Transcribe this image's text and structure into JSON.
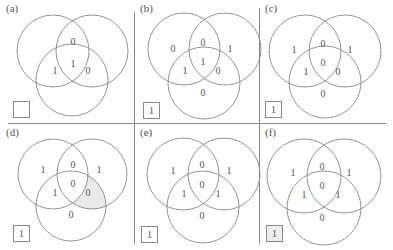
{
  "figure": {
    "layout": {
      "rows": 2,
      "cols": 3
    },
    "panels": [
      {
        "label": "(a)",
        "regions": {
          "A_only": "",
          "B_only": "",
          "C_only": "",
          "AB": "0",
          "AC": "1",
          "BC": "0",
          "ABC": "1"
        },
        "box_value": "",
        "shaded_region": null
      },
      {
        "label": "(b)",
        "regions": {
          "A_only": "0",
          "B_only": "1",
          "C_only": "0",
          "AB": "0",
          "AC": "1",
          "BC": "0",
          "ABC": "1"
        },
        "box_value": "1",
        "shaded_region": null
      },
      {
        "label": "(c)",
        "regions": {
          "A_only": "1",
          "B_only": "1",
          "C_only": "0",
          "AB": "0",
          "AC": "1",
          "BC": "0",
          "ABC": "0"
        },
        "box_value": "1",
        "shaded_region": null
      },
      {
        "label": "(d)",
        "regions": {
          "A_only": "1",
          "B_only": "1",
          "C_only": "0",
          "AB": "0",
          "AC": "1",
          "BC": "0",
          "ABC": "0"
        },
        "box_value": "1",
        "shaded_region": "BC"
      },
      {
        "label": "(e)",
        "regions": {
          "A_only": "1",
          "B_only": "1",
          "C_only": "0",
          "AB": "0",
          "AC": "1",
          "BC": "1",
          "ABC": "0"
        },
        "box_value": "1",
        "shaded_region": null
      },
      {
        "label": "(f)",
        "regions": {
          "A_only": "1",
          "B_only": "1",
          "C_only": "0",
          "AB": "0",
          "AC": "1",
          "BC": "1",
          "ABC": "0"
        },
        "box_value": "1",
        "shaded_region": "box"
      }
    ],
    "colors": {
      "line": "#888888",
      "shade": "#e6e6e6",
      "text": "#555555"
    }
  }
}
